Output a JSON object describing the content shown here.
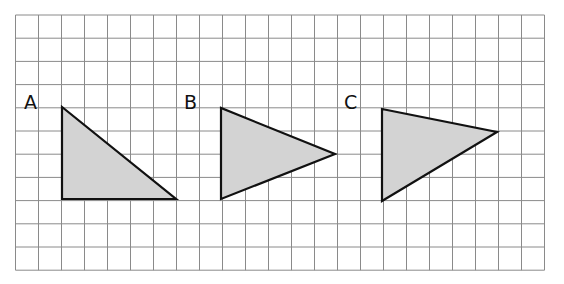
{
  "grid": {
    "x0": 15.5,
    "y0": 15,
    "cell_w": 23.0,
    "cell_h": 23.2,
    "cols": 23,
    "rows": 11,
    "line_color": "#8a8a8a"
  },
  "shapes": [
    {
      "label": "A",
      "label_pos": [
        24,
        109
      ],
      "points": [
        [
          62,
          107
        ],
        [
          62,
          199
        ],
        [
          176,
          199
        ]
      ]
    },
    {
      "label": "B",
      "label_pos": [
        184,
        109
      ],
      "points": [
        [
          221,
          108
        ],
        [
          221,
          199
        ],
        [
          335,
          154
        ]
      ]
    },
    {
      "label": "C",
      "label_pos": [
        344,
        109
      ],
      "points": [
        [
          382,
          109
        ],
        [
          382,
          201
        ],
        [
          497,
          132
        ]
      ]
    }
  ],
  "style": {
    "fill": "#d3d3d3",
    "stroke": "#111111"
  }
}
